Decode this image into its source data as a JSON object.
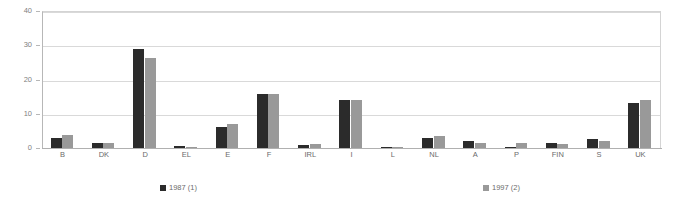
{
  "chart_data": {
    "type": "bar",
    "title": "",
    "subtitle": "",
    "xlabel": "",
    "ylabel": "",
    "ylim": [
      0,
      40
    ],
    "yticks": [
      0,
      10,
      20,
      30,
      40
    ],
    "grid": true,
    "legend_position": "bottom",
    "categories": [
      "B",
      "DK",
      "D",
      "EL",
      "E",
      "F",
      "IRL",
      "I",
      "L",
      "NL",
      "A",
      "P",
      "FIN",
      "S",
      "UK"
    ],
    "series": [
      {
        "name": "1987 (1)",
        "color": "#2b2b2b",
        "values": [
          2.8,
          1.4,
          29.0,
          0.5,
          6.2,
          15.8,
          0.8,
          14.0,
          0.3,
          3.0,
          2.1,
          0.1,
          1.5,
          2.5,
          13.0
        ]
      },
      {
        "name": "1997 (2)",
        "color": "#999999",
        "values": [
          3.8,
          1.4,
          26.3,
          0.4,
          6.9,
          15.9,
          1.2,
          13.9,
          0.3,
          3.5,
          1.6,
          1.5,
          1.3,
          2.0,
          14.0
        ]
      }
    ]
  },
  "legend": {
    "items": [
      {
        "label": "1987 (1)",
        "color": "#2b2b2b"
      },
      {
        "label": "1997 (2)",
        "color": "#999999"
      }
    ]
  },
  "axis": {
    "y_tick_labels": [
      "40",
      "30",
      "20",
      "10",
      "0"
    ]
  }
}
